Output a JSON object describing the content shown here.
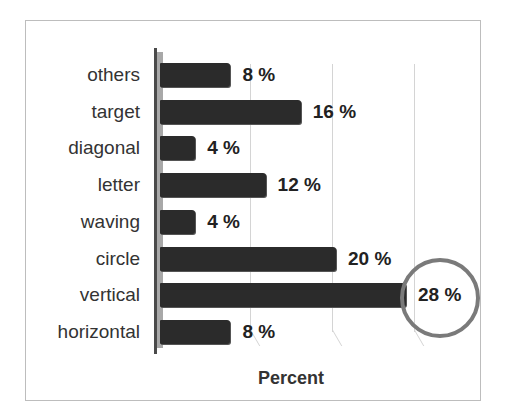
{
  "chart_data": {
    "type": "bar",
    "orientation": "horizontal",
    "title": "",
    "xlabel": "Percent",
    "ylabel": "",
    "categories": [
      "others",
      "target",
      "diagonal",
      "letter",
      "waving",
      "circle",
      "vertical",
      "horizontal"
    ],
    "values": [
      8,
      16,
      4,
      12,
      4,
      20,
      28,
      8
    ],
    "value_labels": [
      "8 %",
      "16 %",
      "4 %",
      "12 %",
      "4 %",
      "20 %",
      "28 %",
      "8 %"
    ],
    "xlim": [
      0,
      30
    ],
    "grid": true,
    "legend": "none",
    "annotations": [
      {
        "type": "circle",
        "target": "vertical",
        "label": "28 %"
      }
    ],
    "bar_color": "#2b2b2b",
    "highlight_color": "#7a7a7a"
  },
  "rows": [
    {
      "label": "others",
      "value": 8,
      "text": "8 %"
    },
    {
      "label": "target",
      "value": 16,
      "text": "16 %"
    },
    {
      "label": "diagonal",
      "value": 4,
      "text": "4 %"
    },
    {
      "label": "letter",
      "value": 12,
      "text": "12 %"
    },
    {
      "label": "waving",
      "value": 4,
      "text": "4 %"
    },
    {
      "label": "circle",
      "value": 20,
      "text": "20 %"
    },
    {
      "label": "vertical",
      "value": 28,
      "text": "28 %"
    },
    {
      "label": "horizontal",
      "value": 8,
      "text": "8 %"
    }
  ]
}
